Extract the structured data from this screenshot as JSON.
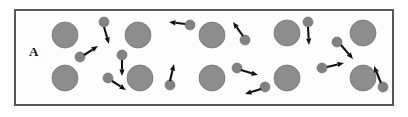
{
  "figure": {
    "panel_label": "A",
    "frame": {
      "x": 14,
      "y": 9,
      "width": 380,
      "height": 97
    },
    "colors": {
      "frame_border": "#57575c",
      "panel_background": "#fdfdfd",
      "large_particle_fill": "#8d8d8d",
      "large_particle_stroke": "#6f6f6f",
      "small_particle_fill": "#828282",
      "small_particle_stroke": "#6a6a6a",
      "arrow": "#111111",
      "label_text": "#1a1a1a"
    }
  },
  "chart_data": {
    "type": "scatter",
    "title": "A",
    "xlabel": "",
    "ylabel": "",
    "xlim": [
      14,
      394
    ],
    "ylim": [
      9,
      106
    ],
    "grid": false,
    "legend": "none",
    "series": [
      {
        "name": "large particles",
        "marker": "filled-circle",
        "radius": 13,
        "color": "#8d8d8d",
        "points": [
          {
            "x": 65,
            "y": 35
          },
          {
            "x": 138,
            "y": 35
          },
          {
            "x": 212,
            "y": 35
          },
          {
            "x": 287,
            "y": 33
          },
          {
            "x": 363,
            "y": 33
          },
          {
            "x": 65,
            "y": 78
          },
          {
            "x": 140,
            "y": 78
          },
          {
            "x": 212,
            "y": 78
          },
          {
            "x": 287,
            "y": 78
          },
          {
            "x": 363,
            "y": 78
          }
        ]
      },
      {
        "name": "small particles",
        "marker": "filled-circle",
        "radius": 5,
        "color": "#828282",
        "points": [
          {
            "x": 104,
            "y": 22
          },
          {
            "x": 190,
            "y": 25
          },
          {
            "x": 245,
            "y": 40
          },
          {
            "x": 308,
            "y": 22
          },
          {
            "x": 337,
            "y": 42
          },
          {
            "x": 80,
            "y": 57
          },
          {
            "x": 122,
            "y": 55
          },
          {
            "x": 108,
            "y": 78
          },
          {
            "x": 170,
            "y": 85
          },
          {
            "x": 237,
            "y": 68
          },
          {
            "x": 265,
            "y": 87
          },
          {
            "x": 322,
            "y": 68
          },
          {
            "x": 383,
            "y": 87
          }
        ]
      }
    ],
    "annotations": [
      {
        "kind": "velocity-arrow",
        "from": {
          "x": 104,
          "y": 27
        },
        "to": {
          "x": 109,
          "y": 44
        }
      },
      {
        "kind": "velocity-arrow",
        "from": {
          "x": 185,
          "y": 24
        },
        "to": {
          "x": 169,
          "y": 22
        }
      },
      {
        "kind": "velocity-arrow",
        "from": {
          "x": 243,
          "y": 36
        },
        "to": {
          "x": 233,
          "y": 22
        }
      },
      {
        "kind": "velocity-arrow",
        "from": {
          "x": 308,
          "y": 27
        },
        "to": {
          "x": 309,
          "y": 45
        }
      },
      {
        "kind": "velocity-arrow",
        "from": {
          "x": 341,
          "y": 45
        },
        "to": {
          "x": 353,
          "y": 59
        }
      },
      {
        "kind": "velocity-arrow",
        "from": {
          "x": 84,
          "y": 55
        },
        "to": {
          "x": 98,
          "y": 46
        }
      },
      {
        "kind": "velocity-arrow",
        "from": {
          "x": 122,
          "y": 60
        },
        "to": {
          "x": 122,
          "y": 76
        }
      },
      {
        "kind": "velocity-arrow",
        "from": {
          "x": 112,
          "y": 81
        },
        "to": {
          "x": 126,
          "y": 90
        }
      },
      {
        "kind": "velocity-arrow",
        "from": {
          "x": 170,
          "y": 81
        },
        "to": {
          "x": 174,
          "y": 64
        }
      },
      {
        "kind": "velocity-arrow",
        "from": {
          "x": 241,
          "y": 70
        },
        "to": {
          "x": 258,
          "y": 75
        }
      },
      {
        "kind": "velocity-arrow",
        "from": {
          "x": 261,
          "y": 89
        },
        "to": {
          "x": 245,
          "y": 94
        }
      },
      {
        "kind": "velocity-arrow",
        "from": {
          "x": 327,
          "y": 67
        },
        "to": {
          "x": 344,
          "y": 63
        }
      },
      {
        "kind": "velocity-arrow",
        "from": {
          "x": 381,
          "y": 83
        },
        "to": {
          "x": 374,
          "y": 66
        }
      }
    ]
  }
}
